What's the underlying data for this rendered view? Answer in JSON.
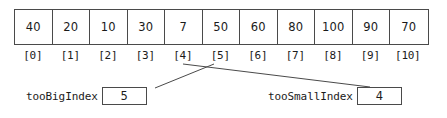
{
  "diagram": {
    "array": {
      "name": "array-cells",
      "values": [
        "40",
        "20",
        "10",
        "30",
        "7",
        "50",
        "60",
        "80",
        "100",
        "90",
        "70"
      ],
      "index_labels": [
        "[0]",
        "[1]",
        "[2]",
        "[3]",
        "[4]",
        "[5]",
        "[6]",
        "[7]",
        "[8]",
        "[9]",
        "[10]"
      ]
    },
    "variables": [
      {
        "id": "tooBigIndex",
        "label": "tooBigIndex",
        "value": "5",
        "points_to_index": "[5]"
      },
      {
        "id": "tooSmallIndex",
        "label": "tooSmallIndex",
        "value": "4",
        "points_to_index": "[4]"
      }
    ],
    "colors": {
      "line": "#4a4a4a",
      "text": "#1a1a1a",
      "background": "#ffffff"
    }
  }
}
